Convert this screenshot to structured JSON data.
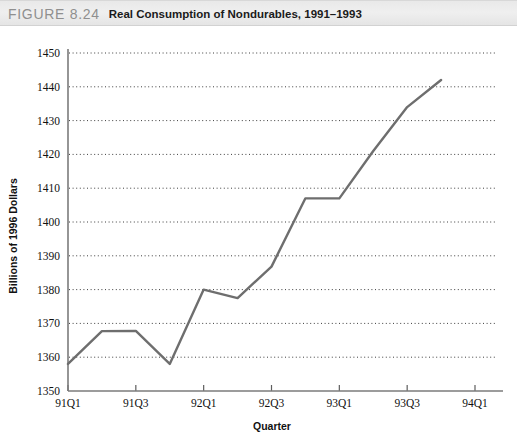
{
  "header": {
    "figure_label": "FIGURE 8.24",
    "figure_title": "Real Consumption of Nondurables, 1991–1993"
  },
  "chart_data": {
    "type": "line",
    "title": "Real Consumption of Nondurables, 1991–1993",
    "xlabel": "Quarter",
    "ylabel": "Billions of 1996 Dollars",
    "ylim": [
      1350,
      1450
    ],
    "ytick_step": 10,
    "ytick_labels": [
      "1350",
      "1360",
      "1370",
      "1380",
      "1390",
      "1400",
      "1410",
      "1420",
      "1430",
      "1440",
      "1450"
    ],
    "ytick_values": [
      1350,
      1360,
      1370,
      1380,
      1390,
      1400,
      1410,
      1420,
      1430,
      1440,
      1450
    ],
    "xtick_labels": [
      "91Q1",
      "91Q3",
      "92Q1",
      "92Q3",
      "93Q1",
      "93Q3",
      "94Q1"
    ],
    "xtick_values": [
      0,
      2,
      4,
      6,
      8,
      10,
      12
    ],
    "xlim": [
      0,
      12
    ],
    "grid": "horizontal-dotted",
    "legend": "none",
    "categories": [
      "91Q1",
      "91Q2",
      "91Q3",
      "91Q4",
      "92Q1",
      "92Q2",
      "92Q3",
      "92Q4",
      "93Q1",
      "93Q2",
      "93Q3",
      "93Q4"
    ],
    "x": [
      0,
      1,
      2,
      3,
      4,
      5,
      6,
      7,
      8,
      9,
      10,
      11
    ],
    "values": [
      1358.0,
      1367.7,
      1367.8,
      1358.0,
      1380.0,
      1377.5,
      1386.8,
      1407.0,
      1407.0,
      1421.0,
      1434.0,
      1442.0
    ],
    "series": [
      {
        "name": "Real Consumption of Nondurables",
        "values": [
          1358.0,
          1367.7,
          1367.8,
          1358.0,
          1380.0,
          1377.5,
          1386.8,
          1407.0,
          1407.0,
          1421.0,
          1434.0,
          1442.0
        ]
      }
    ],
    "line_color": "#6e6e6e",
    "grid_color": "#3d3d3d",
    "axis_color": "#7b7b7b"
  }
}
